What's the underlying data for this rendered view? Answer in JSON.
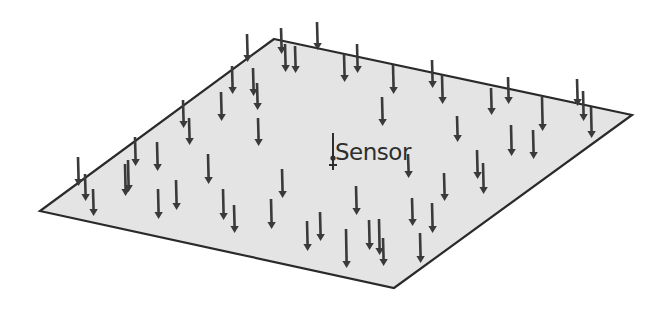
{
  "diagram": {
    "title": "",
    "canvas": {
      "width": 671,
      "height": 311,
      "background": "#ffffff"
    },
    "plane": {
      "shape": "parallelogram",
      "corners": {
        "top": [
          274,
          39
        ],
        "right": [
          632,
          115
        ],
        "bottom": [
          394,
          288
        ],
        "left": [
          40,
          211
        ]
      },
      "fill": "#e4e4e4",
      "stroke": "#2a2a2a"
    },
    "sensor": {
      "label": "Sensor",
      "label_position": [
        335,
        160
      ],
      "marker": {
        "x": 333,
        "y_top": 133,
        "y_bottom": 170,
        "dot_y": 158
      }
    },
    "arrows": {
      "direction": "down",
      "color": "#3a3a3a",
      "count": 58,
      "items": [
        {
          "x": 247,
          "y1": 34,
          "y2": 62
        },
        {
          "x": 281,
          "y1": 28,
          "y2": 54
        },
        {
          "x": 285,
          "y1": 44,
          "y2": 72
        },
        {
          "x": 295,
          "y1": 46,
          "y2": 73
        },
        {
          "x": 317,
          "y1": 22,
          "y2": 50
        },
        {
          "x": 232,
          "y1": 66,
          "y2": 94
        },
        {
          "x": 253,
          "y1": 68,
          "y2": 96
        },
        {
          "x": 221,
          "y1": 92,
          "y2": 121
        },
        {
          "x": 257,
          "y1": 83,
          "y2": 110
        },
        {
          "x": 183,
          "y1": 100,
          "y2": 128
        },
        {
          "x": 189,
          "y1": 118,
          "y2": 145
        },
        {
          "x": 258,
          "y1": 118,
          "y2": 146
        },
        {
          "x": 344,
          "y1": 54,
          "y2": 82
        },
        {
          "x": 357,
          "y1": 44,
          "y2": 73
        },
        {
          "x": 393,
          "y1": 65,
          "y2": 94
        },
        {
          "x": 432,
          "y1": 60,
          "y2": 88
        },
        {
          "x": 442,
          "y1": 75,
          "y2": 104
        },
        {
          "x": 382,
          "y1": 97,
          "y2": 126
        },
        {
          "x": 457,
          "y1": 116,
          "y2": 142
        },
        {
          "x": 491,
          "y1": 88,
          "y2": 115
        },
        {
          "x": 508,
          "y1": 77,
          "y2": 104
        },
        {
          "x": 542,
          "y1": 97,
          "y2": 131
        },
        {
          "x": 577,
          "y1": 79,
          "y2": 106
        },
        {
          "x": 583,
          "y1": 91,
          "y2": 121
        },
        {
          "x": 591,
          "y1": 107,
          "y2": 138
        },
        {
          "x": 511,
          "y1": 125,
          "y2": 156
        },
        {
          "x": 533,
          "y1": 130,
          "y2": 159
        },
        {
          "x": 477,
          "y1": 150,
          "y2": 179
        },
        {
          "x": 483,
          "y1": 163,
          "y2": 194
        },
        {
          "x": 444,
          "y1": 173,
          "y2": 201
        },
        {
          "x": 408,
          "y1": 154,
          "y2": 178
        },
        {
          "x": 412,
          "y1": 198,
          "y2": 226
        },
        {
          "x": 432,
          "y1": 203,
          "y2": 233
        },
        {
          "x": 420,
          "y1": 233,
          "y2": 263
        },
        {
          "x": 356,
          "y1": 186,
          "y2": 215
        },
        {
          "x": 369,
          "y1": 220,
          "y2": 250
        },
        {
          "x": 379,
          "y1": 219,
          "y2": 255
        },
        {
          "x": 383,
          "y1": 238,
          "y2": 266
        },
        {
          "x": 346,
          "y1": 229,
          "y2": 268
        },
        {
          "x": 320,
          "y1": 212,
          "y2": 241
        },
        {
          "x": 307,
          "y1": 221,
          "y2": 251
        },
        {
          "x": 282,
          "y1": 169,
          "y2": 198
        },
        {
          "x": 271,
          "y1": 199,
          "y2": 229
        },
        {
          "x": 234,
          "y1": 205,
          "y2": 233
        },
        {
          "x": 223,
          "y1": 189,
          "y2": 220
        },
        {
          "x": 208,
          "y1": 154,
          "y2": 184
        },
        {
          "x": 176,
          "y1": 180,
          "y2": 210
        },
        {
          "x": 158,
          "y1": 189,
          "y2": 219
        },
        {
          "x": 157,
          "y1": 142,
          "y2": 171
        },
        {
          "x": 135,
          "y1": 137,
          "y2": 166
        },
        {
          "x": 125,
          "y1": 164,
          "y2": 196
        },
        {
          "x": 93,
          "y1": 189,
          "y2": 216
        },
        {
          "x": 85,
          "y1": 174,
          "y2": 201
        },
        {
          "x": 78,
          "y1": 157,
          "y2": 186
        },
        {
          "x": 128,
          "y1": 160,
          "y2": 192
        },
        {
          "x": 205,
          "y1": 30,
          "y2": 30
        },
        {
          "x": 365,
          "y1": 100,
          "y2": 100
        },
        {
          "x": 440,
          "y1": 120,
          "y2": 120
        }
      ]
    }
  }
}
